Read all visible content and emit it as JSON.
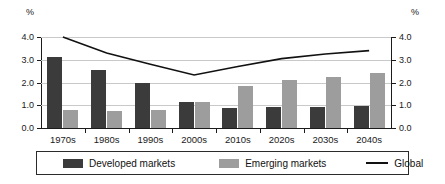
{
  "axes": {
    "left_unit": "%",
    "right_unit": "%",
    "ytick_labels": [
      "4.0",
      "3.0",
      "2.0",
      "1.0",
      "0.0"
    ]
  },
  "legend": {
    "items": [
      {
        "label": "Developed markets",
        "marker": "dark-square-swatch",
        "color": "#3b3b3b"
      },
      {
        "label": "Emerging markets",
        "marker": "gray-square-swatch",
        "color": "#9d9d9d"
      },
      {
        "label": "Global",
        "marker": "line-swatch",
        "color": "#111111"
      }
    ]
  },
  "chart_data": {
    "type": "bar",
    "title": "",
    "subtitle": "",
    "xlabel": "",
    "ylabel": "%",
    "y2label": "%",
    "ylim": [
      0.0,
      4.0
    ],
    "yticks": [
      0.0,
      1.0,
      2.0,
      3.0,
      4.0
    ],
    "grid": true,
    "legend_position": "bottom",
    "categories": [
      "1970s",
      "1980s",
      "1990s",
      "2000s",
      "2010s",
      "2020s",
      "2030s",
      "2040s"
    ],
    "series": [
      {
        "name": "Developed markets",
        "type": "bar",
        "color": "#3b3b3b",
        "values": [
          3.12,
          2.55,
          1.98,
          1.14,
          0.86,
          0.92,
          0.93,
          0.96
        ]
      },
      {
        "name": "Emerging markets",
        "type": "bar",
        "color": "#9d9d9d",
        "values": [
          0.78,
          0.74,
          0.79,
          1.14,
          1.84,
          2.11,
          2.23,
          2.4
        ]
      },
      {
        "name": "Global",
        "type": "line",
        "color": "#111111",
        "values": [
          4.0,
          3.3,
          2.8,
          2.33,
          2.7,
          3.05,
          3.25,
          3.4
        ]
      }
    ]
  }
}
